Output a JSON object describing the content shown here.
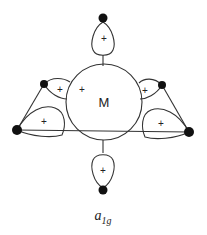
{
  "diagram": {
    "metal_label": "M",
    "symmetry_label": "a",
    "symmetry_subscript": "1g",
    "phase_sign": "+",
    "colors": {
      "line": "#333333",
      "dot": "#111111"
    },
    "lobes": [
      {
        "position": "top",
        "sign": "+"
      },
      {
        "position": "bottom",
        "sign": "+"
      },
      {
        "position": "upper-left",
        "sign": "+"
      },
      {
        "position": "upper-right",
        "sign": "+"
      },
      {
        "position": "lower-left",
        "sign": "+"
      },
      {
        "position": "lower-right",
        "sign": "+"
      },
      {
        "position": "metal-center",
        "sign": "+"
      }
    ]
  }
}
